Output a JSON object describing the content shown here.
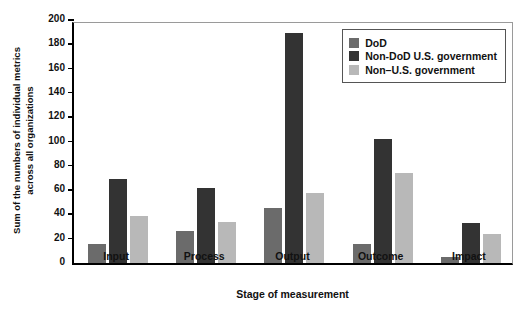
{
  "chart_data": {
    "type": "bar",
    "title": "",
    "xlabel": "Stage of measurement",
    "ylabel": "Sum of the numbers of individual metrics across all organizations",
    "ylabel_lines": [
      "Sum of the numbers of individual metrics",
      "across all organizations"
    ],
    "categories": [
      "Input",
      "Process",
      "Output",
      "Outcome",
      "Impact"
    ],
    "series": [
      {
        "name": "DoD",
        "color": "#6b6b6b",
        "values": [
          16,
          26,
          45,
          16,
          5
        ]
      },
      {
        "name": "Non-DoD U.S. government",
        "color": "#333333",
        "values": [
          69,
          62,
          189,
          102,
          33
        ]
      },
      {
        "name": "Non–U.S. government",
        "color": "#b8b8b8",
        "values": [
          39,
          34,
          58,
          74,
          24
        ]
      }
    ],
    "ylim": [
      0,
      200
    ],
    "yticks": [
      0,
      20,
      40,
      60,
      80,
      100,
      120,
      140,
      160,
      180,
      200
    ],
    "ytick_labels": [
      "0",
      "20",
      "40",
      "60",
      "80",
      "100",
      "120",
      "140",
      "160",
      "180",
      "200"
    ],
    "grid": false,
    "legend_position": "top-right"
  },
  "legend": {
    "entries": [
      {
        "label": "DoD",
        "color": "#6b6b6b"
      },
      {
        "label": "Non-DoD U.S. government",
        "color": "#333333"
      },
      {
        "label": "Non–U.S. government",
        "color": "#b8b8b8"
      }
    ]
  }
}
